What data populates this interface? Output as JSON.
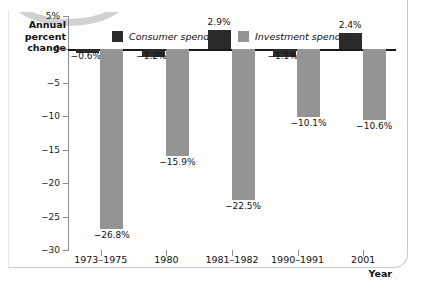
{
  "axes": {
    "y_title": "Annual\npercent\nchange",
    "y_title_lines": [
      "Annual",
      "percent",
      "change"
    ],
    "x_title": "Year"
  },
  "legend": {
    "items": [
      {
        "label": "Consumer spending",
        "color": "#2b2b2b",
        "swatch_name": "legend-swatch-consumer"
      },
      {
        "label": "Investment spending",
        "color": "#949494",
        "swatch_name": "legend-swatch-investment"
      }
    ]
  },
  "chart_data": {
    "type": "bar",
    "title": "",
    "subtitle": "",
    "xlabel": "Year",
    "ylabel": "Annual percent change",
    "categories": [
      "1973–1975",
      "1980",
      "1981–1982",
      "1990–1991",
      "2001"
    ],
    "series": [
      {
        "name": "Consumer spending",
        "color": "#2b2b2b",
        "values": [
          -0.6,
          -1.2,
          2.9,
          -1.1,
          2.4
        ],
        "labels": [
          "−0.6%",
          "−1.2%",
          "2.9%",
          "−1.1%",
          "2.4%"
        ]
      },
      {
        "name": "Investment spending",
        "color": "#949494",
        "values": [
          -26.8,
          -15.9,
          -22.5,
          -10.1,
          -10.6
        ],
        "labels": [
          "−26.8%",
          "−15.9%",
          "−22.5%",
          "−10.1%",
          "−10.6%"
        ]
      }
    ],
    "ylim": [
      -30,
      5
    ],
    "yticks": [
      5,
      0,
      -5,
      -10,
      -15,
      -20,
      -25,
      -30
    ],
    "ytick_labels": [
      "5%",
      "0",
      "−5",
      "−10",
      "−15",
      "−20",
      "−25",
      "−30"
    ],
    "grid": false,
    "legend_position": "top-center",
    "zero_line": true
  }
}
